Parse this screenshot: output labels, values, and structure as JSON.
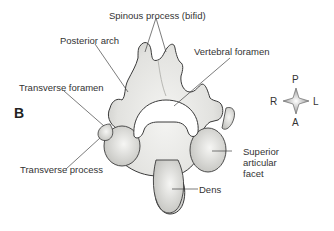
{
  "figure": {
    "panel_label": "B",
    "labels": {
      "spinous_process": "Spinous process (bifid)",
      "posterior_arch": "Posterior arch",
      "vertebral_foramen": "Vertebral foramen",
      "transverse_foramen": "Transverse foramen",
      "transverse_process": "Transverse process",
      "superior_articular_facet_1": "Superior",
      "superior_articular_facet_2": "articular",
      "superior_articular_facet_3": "facet",
      "dens": "Dens"
    },
    "compass": {
      "top": "P",
      "bottom": "A",
      "left": "R",
      "right": "L",
      "icon": "compass-star-icon"
    },
    "colors": {
      "bone_fill": "#e6e6e4",
      "bone_shadow": "#bdbdba",
      "outline": "#3a3a3a",
      "leader_line": "#444444",
      "text": "#333333"
    }
  }
}
